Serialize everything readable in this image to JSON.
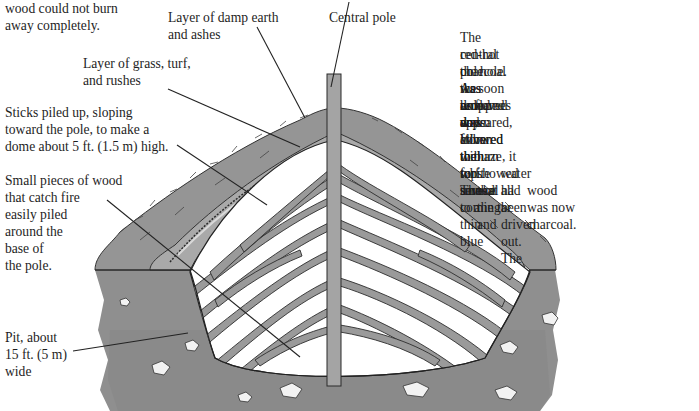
{
  "diagram": {
    "type": "cross-section illustration",
    "colors": {
      "earth": "#8f8f8f",
      "earth_dark": "#6e6e6e",
      "turf_layer": "#a9a9a9",
      "wood_fill": "#9a9a9a",
      "wood_gaps": "#ffffff",
      "pole": "#a4a4a4",
      "outline": "#2a2a2a",
      "text": "#1e1e1e"
    }
  },
  "labels": {
    "top_left_fragment": "wood could not burn\naway completely.",
    "damp_earth": "Layer of damp earth\nand ashes",
    "central_pole": "Central pole",
    "grass_turf": "Layer of grass, turf,\nand rushes",
    "sticks": "Sticks piled up, sloping\ntoward the pole, to make a\ndome about 5 ft. (1.5 m) high.",
    "small_pieces": "Small pieces of wood\nthat catch fire\neasily piled\naround the\nbase of\nthe pole.",
    "pit": "Pit, about\n15 ft. (5 m)\nwide"
  },
  "description": {
    "lines": [
      "The central pole was removed and",
      "red-hot charcoal was dropped down",
      "the hole. As soon as flames appeared,",
      "the hole was covered with turf. The",
      "wood was allowed to burn for several",
      "days. When the white smoke coming",
      "from the top turned to a thin blue",
      "haze, it showed that all the tar and",
      "water had been driven out. The",
      "wood was now charcoal."
    ]
  }
}
